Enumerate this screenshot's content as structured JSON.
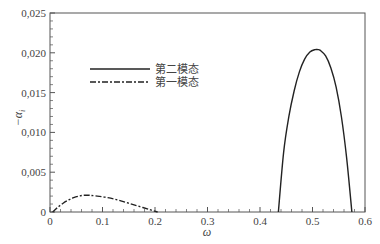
{
  "chart_data": {
    "type": "line",
    "title": "",
    "xlabel": "ω",
    "ylabel": "−α_i",
    "xlim": [
      0,
      0.6
    ],
    "ylim": [
      0,
      0.025
    ],
    "xticks": [
      "0",
      "0.1",
      "0.2",
      "0.3",
      "0.4",
      "0.5",
      "0.6"
    ],
    "yticks": [
      "0",
      "0,005",
      "0,010",
      "0,015",
      "0,020",
      "0,025"
    ],
    "grid": false,
    "legend_position": "upper-left (inside)",
    "series": [
      {
        "name": "第二模态",
        "style": "solid",
        "color": "#222222",
        "x": [
          0.435,
          0.445,
          0.455,
          0.465,
          0.475,
          0.485,
          0.495,
          0.505,
          0.51,
          0.515,
          0.525,
          0.535,
          0.545,
          0.555,
          0.565,
          0.575
        ],
        "y": [
          0.0,
          0.0075,
          0.012,
          0.0152,
          0.0176,
          0.0192,
          0.0201,
          0.0204,
          0.0204,
          0.0203,
          0.0196,
          0.0181,
          0.0157,
          0.012,
          0.0068,
          0.0
        ]
      },
      {
        "name": "第一模态",
        "style": "dashdot",
        "color": "#222222",
        "x": [
          0.005,
          0.015,
          0.025,
          0.035,
          0.045,
          0.055,
          0.065,
          0.075,
          0.09,
          0.11,
          0.13,
          0.15,
          0.17,
          0.19,
          0.205
        ],
        "y": [
          0.0,
          0.0006,
          0.0011,
          0.0015,
          0.0018,
          0.002,
          0.0021,
          0.0021,
          0.002,
          0.0018,
          0.0015,
          0.0011,
          0.0007,
          0.0003,
          0.0
        ]
      }
    ]
  },
  "legend": {
    "items": [
      {
        "label": "第二模态",
        "style": "solid"
      },
      {
        "label": "第一模态",
        "style": "dashdot"
      }
    ]
  },
  "axes": {
    "x_label": "ω",
    "y_label_main": "−α",
    "y_label_sub": "i"
  }
}
